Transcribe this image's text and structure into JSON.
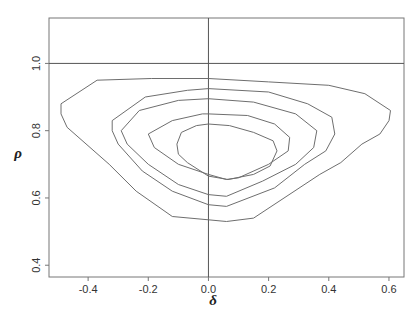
{
  "chart_data": {
    "type": "contour",
    "title": "",
    "xlabel": "δ",
    "ylabel": "ρ",
    "xlim": [
      -0.53,
      0.65
    ],
    "ylim": [
      0.365,
      1.135
    ],
    "x_ticks": [
      -0.4,
      -0.2,
      0.0,
      0.2,
      0.4,
      0.6
    ],
    "x_tick_labels": [
      "-0.4",
      "-0.2",
      "0.0",
      "0.2",
      "0.4",
      "0.6"
    ],
    "y_ticks": [
      0.4,
      0.6,
      0.8,
      1.0
    ],
    "y_tick_labels": [
      "0.4",
      "0.6",
      "0.8",
      "1.0"
    ],
    "reference_lines": [
      {
        "orientation": "horizontal",
        "value": 1.0
      },
      {
        "orientation": "vertical",
        "value": 0.0
      }
    ],
    "grid": false,
    "legend": null,
    "contour_levels": 5,
    "contours": [
      {
        "level_index": 1,
        "description": "outermost",
        "points": [
          [
            -0.49,
            0.88
          ],
          [
            -0.37,
            0.95
          ],
          [
            -0.19,
            0.955
          ],
          [
            0.0,
            0.955
          ],
          [
            0.2,
            0.945
          ],
          [
            0.4,
            0.935
          ],
          [
            0.52,
            0.91
          ],
          [
            0.605,
            0.86
          ],
          [
            0.6,
            0.83
          ],
          [
            0.57,
            0.79
          ],
          [
            0.51,
            0.76
          ],
          [
            0.44,
            0.705
          ],
          [
            0.37,
            0.67
          ],
          [
            0.15,
            0.54
          ],
          [
            0.06,
            0.53
          ],
          [
            0.0,
            0.535
          ],
          [
            -0.12,
            0.545
          ],
          [
            -0.24,
            0.62
          ],
          [
            -0.33,
            0.7
          ],
          [
            -0.47,
            0.81
          ],
          [
            -0.49,
            0.85
          ]
        ]
      },
      {
        "level_index": 2,
        "points": [
          [
            -0.32,
            0.83
          ],
          [
            -0.21,
            0.9
          ],
          [
            -0.07,
            0.92
          ],
          [
            0.0,
            0.925
          ],
          [
            0.2,
            0.915
          ],
          [
            0.33,
            0.88
          ],
          [
            0.41,
            0.84
          ],
          [
            0.42,
            0.79
          ],
          [
            0.39,
            0.74
          ],
          [
            0.32,
            0.7
          ],
          [
            0.22,
            0.63
          ],
          [
            0.06,
            0.575
          ],
          [
            0.0,
            0.58
          ],
          [
            -0.12,
            0.62
          ],
          [
            -0.22,
            0.68
          ],
          [
            -0.3,
            0.76
          ],
          [
            -0.32,
            0.8
          ]
        ]
      },
      {
        "level_index": 3,
        "points": [
          [
            -0.29,
            0.8
          ],
          [
            -0.23,
            0.86
          ],
          [
            -0.1,
            0.89
          ],
          [
            0.0,
            0.895
          ],
          [
            0.15,
            0.885
          ],
          [
            0.29,
            0.85
          ],
          [
            0.36,
            0.8
          ],
          [
            0.35,
            0.75
          ],
          [
            0.29,
            0.7
          ],
          [
            0.18,
            0.65
          ],
          [
            0.06,
            0.605
          ],
          [
            0.0,
            0.61
          ],
          [
            -0.1,
            0.64
          ],
          [
            -0.2,
            0.7
          ],
          [
            -0.27,
            0.76
          ]
        ]
      },
      {
        "level_index": 4,
        "points": [
          [
            -0.2,
            0.79
          ],
          [
            -0.12,
            0.83
          ],
          [
            -0.02,
            0.85
          ],
          [
            0.0,
            0.85
          ],
          [
            0.13,
            0.845
          ],
          [
            0.22,
            0.82
          ],
          [
            0.27,
            0.78
          ],
          [
            0.265,
            0.74
          ],
          [
            0.2,
            0.7
          ],
          [
            0.1,
            0.66
          ],
          [
            0.06,
            0.655
          ],
          [
            0.0,
            0.67
          ],
          [
            -0.1,
            0.7
          ],
          [
            -0.18,
            0.75
          ]
        ]
      },
      {
        "level_index": 5,
        "description": "innermost",
        "points": [
          [
            -0.105,
            0.76
          ],
          [
            -0.09,
            0.795
          ],
          [
            -0.04,
            0.815
          ],
          [
            0.0,
            0.82
          ],
          [
            0.07,
            0.815
          ],
          [
            0.15,
            0.795
          ],
          [
            0.215,
            0.77
          ],
          [
            0.228,
            0.74
          ],
          [
            0.205,
            0.695
          ],
          [
            0.15,
            0.67
          ],
          [
            0.065,
            0.655
          ],
          [
            0.0,
            0.665
          ],
          [
            -0.07,
            0.705
          ],
          [
            -0.1,
            0.73
          ]
        ]
      }
    ],
    "peak_region": {
      "delta": 0.06,
      "rho": 0.74
    }
  },
  "colors": {
    "contour_stroke": "#6e6e6e",
    "frame_stroke": "#777777",
    "background": "#ffffff"
  }
}
